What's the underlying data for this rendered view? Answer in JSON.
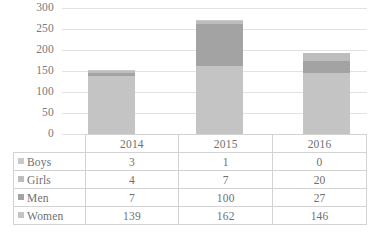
{
  "chart_data": {
    "type": "bar",
    "subtype": "stacked-column",
    "title": "",
    "xlabel": "",
    "ylabel": "",
    "ylim": [
      0,
      300
    ],
    "yticks": [
      300,
      250,
      200,
      150,
      100,
      50,
      0
    ],
    "grid": true,
    "legend_position": "data-table-row-headers",
    "categories": [
      "2014",
      "2015",
      "2016"
    ],
    "series": [
      {
        "name": "Boys",
        "values": [
          3,
          1,
          0
        ],
        "color": "#c9c9c9"
      },
      {
        "name": "Girls",
        "values": [
          4,
          7,
          20
        ],
        "color": "#bdbdbd"
      },
      {
        "name": "Men",
        "values": [
          7,
          100,
          27
        ],
        "color": "#a3a3a3"
      },
      {
        "name": "Women",
        "values": [
          139,
          162,
          146
        ],
        "color": "#c4c4c4"
      }
    ],
    "totals": [
      153,
      270,
      193
    ]
  },
  "table": {
    "corner": "",
    "columns": [
      "2014",
      "2015",
      "2016"
    ],
    "rows": [
      {
        "label": "Boys",
        "values": [
          "3",
          "1",
          "0"
        ]
      },
      {
        "label": "Girls",
        "values": [
          "4",
          "7",
          "20"
        ]
      },
      {
        "label": "Men",
        "values": [
          "7",
          "100",
          "27"
        ]
      },
      {
        "label": "Women",
        "values": [
          "139",
          "162",
          "146"
        ]
      }
    ]
  },
  "axis": {
    "y_labels": [
      "300",
      "250",
      "200",
      "150",
      "100",
      "50",
      "0"
    ]
  },
  "colors": {
    "gridline": "#e2e2e2",
    "table_border": "#d3d3d3",
    "text": "#7a7a7a",
    "women": "#c4c4c4",
    "men": "#a3a3a3",
    "girls": "#bdbdbd",
    "boys": "#c9c9c9"
  }
}
